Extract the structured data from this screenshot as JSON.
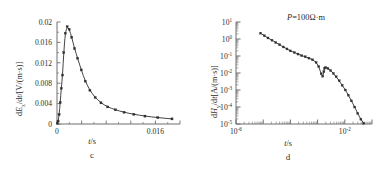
{
  "figure": {
    "panels": [
      {
        "id": "c",
        "caption": "c",
        "xlabel": "t/s",
        "ylabel": "dEx/dt/[V/(m·s)]",
        "annotation": ""
      },
      {
        "id": "d",
        "caption": "d",
        "xlabel": "t/s",
        "ylabel": "dHy/dt[A/(m·s)]",
        "annotation": "P=100Ω·m"
      }
    ],
    "line_color": "#3a3a3a",
    "axis_color": "#6f6f6f",
    "marker_color": "#303030"
  },
  "chart_data": [
    {
      "type": "line",
      "id": "c",
      "title": "",
      "subtitle": "c",
      "xlabel": "t/s",
      "ylabel": "dEx/dt/[V/(m·s)]",
      "xscale": "linear",
      "yscale": "linear",
      "xlim": [
        0,
        0.02
      ],
      "ylim": [
        0,
        0.02
      ],
      "xticks": [
        0,
        0.004,
        0.008,
        0.012,
        0.016,
        0.02
      ],
      "xticklabels": [
        "0",
        "",
        "",
        "",
        "0.016",
        ""
      ],
      "yticks": [
        0,
        0.004,
        0.008,
        0.012,
        0.016,
        0.02
      ],
      "yticklabels": [
        "0",
        "0.004",
        "0.008",
        "0.012",
        "0.016",
        "0.02"
      ],
      "grid": false,
      "legend": "none",
      "markers": "square",
      "x": [
        5e-05,
        0.00018,
        0.00035,
        0.00052,
        0.0007,
        0.0009,
        0.0011,
        0.00135,
        0.00165,
        0.002,
        0.0024,
        0.00285,
        0.00335,
        0.00395,
        0.0046,
        0.00535,
        0.0062,
        0.00715,
        0.00825,
        0.0095,
        0.0109,
        0.0125,
        0.0143,
        0.0164,
        0.0187
      ],
      "y": [
        0.00012,
        0.00055,
        0.00185,
        0.0042,
        0.007,
        0.0096,
        0.014,
        0.0178,
        0.0191,
        0.01855,
        0.017,
        0.0148,
        0.0129,
        0.0106,
        0.0084,
        0.0066,
        0.0052,
        0.00415,
        0.00335,
        0.00278,
        0.0023,
        0.0019,
        0.00155,
        0.00125,
        0.001
      ]
    },
    {
      "type": "line",
      "id": "d",
      "title": "",
      "subtitle": "d",
      "xlabel": "t/s",
      "ylabel": "dHy/dt[A/(m·s)]",
      "xscale": "log",
      "yscale": "log",
      "xlim": [
        1e-06,
        0.1
      ],
      "ylim": [
        1e-05,
        10.0
      ],
      "xticks": [
        1e-06,
        1e-05,
        0.0001,
        0.001,
        0.01,
        0.1
      ],
      "xticklabels": [
        "10-6",
        "",
        "",
        "",
        "10-2",
        ""
      ],
      "yticks": [
        1e-05,
        0.0001,
        0.001,
        0.01,
        0.1,
        1.0,
        10.0
      ],
      "yticklabels": [
        "10-5",
        "10-4",
        "10-3",
        "10-2",
        "10-1",
        "100",
        "101"
      ],
      "grid": false,
      "legend": "none",
      "markers": "diamond",
      "annotation": "P=100Ω·m",
      "x": [
        8e-06,
        1.1e-05,
        1.5e-05,
        2.1e-05,
        2.9e-05,
        4e-05,
        5.5e-05,
        7.5e-05,
        0.0001,
        0.00014,
        0.00019,
        0.00026,
        0.00035,
        0.00048,
        0.00065,
        0.00088,
        0.0011,
        0.00135,
        0.00155,
        0.0017,
        0.0018,
        0.002,
        0.0024,
        0.003,
        0.0038,
        0.0048,
        0.0062,
        0.008,
        0.0105,
        0.0135,
        0.0175,
        0.023,
        0.03,
        0.039,
        0.05
      ],
      "y": [
        2.2,
        1.55,
        1.15,
        0.85,
        0.62,
        0.46,
        0.34,
        0.26,
        0.2,
        0.16,
        0.13,
        0.105,
        0.09,
        0.075,
        0.06,
        0.042,
        0.024,
        0.009,
        0.0065,
        0.012,
        0.019,
        0.021,
        0.0185,
        0.014,
        0.0095,
        0.006,
        0.0035,
        0.0019,
        0.001,
        0.0005,
        0.00023,
        0.0001,
        4.2e-05,
        1.9e-05,
        1.1e-05
      ]
    }
  ]
}
